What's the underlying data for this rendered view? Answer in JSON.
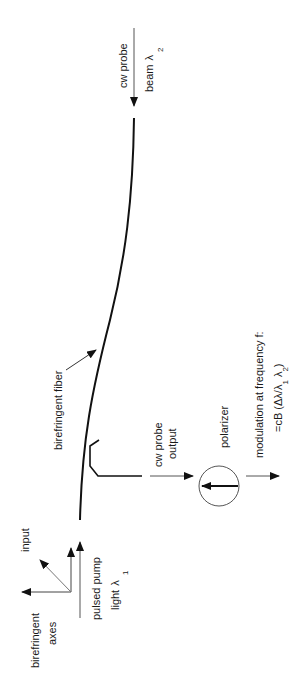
{
  "diagram": {
    "orientation": "rotated-90-ccw",
    "labels": {
      "probe_in_line1": "cw probe",
      "probe_in_line2": "beam",
      "probe_in_lambda": "λ",
      "probe_in_sub": "2",
      "fiber": "birefringent fiber",
      "probe_out_line1": "cw probe",
      "probe_out_line2": "output",
      "polarizer": "polarizer",
      "modulation_line1": "modulation at frequency f:",
      "modulation_line2": "=cB (Δλ/λ",
      "modulation_sub1": "1",
      "modulation_lambda2": " λ",
      "modulation_sub2": "2",
      "modulation_close": ")",
      "input": "input",
      "pump_line1": "pulsed pump",
      "pump_line2": "light",
      "pump_lambda": "λ",
      "pump_sub": "1",
      "axes_line1": "birefringent",
      "axes_line2": "axes"
    },
    "colors": {
      "line": "#111111",
      "thin": "#555555"
    }
  }
}
